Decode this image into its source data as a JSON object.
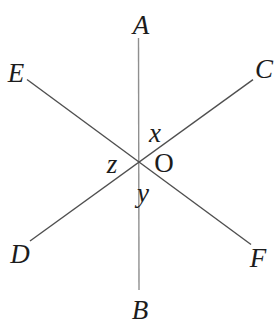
{
  "diagram": {
    "type": "intersecting-lines-figure",
    "point_labels": {
      "a": "A",
      "b": "B",
      "c": "C",
      "d": "D",
      "e": "E",
      "f": "F",
      "o": "O"
    },
    "angle_labels": {
      "x": "x",
      "y": "y",
      "z": "z"
    },
    "colors": {
      "diagonal_line": "#4f4f4f",
      "vertical_line": "#8f8f8f",
      "text": "#1c1c1c",
      "background": "#ffffff"
    }
  }
}
